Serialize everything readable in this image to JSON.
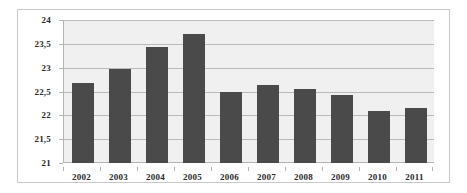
{
  "chart_data": {
    "type": "bar",
    "title": "",
    "subtitle": "",
    "xlabel": "",
    "ylabel": "",
    "categories": [
      "2002",
      "2003",
      "2004",
      "2005",
      "2006",
      "2007",
      "2008",
      "2009",
      "2010",
      "2011"
    ],
    "values": [
      22.68,
      22.98,
      23.44,
      23.7,
      22.5,
      22.64,
      22.55,
      22.42,
      22.1,
      22.16
    ],
    "series": [
      {
        "name": "",
        "values": [
          22.68,
          22.98,
          23.44,
          23.7,
          22.5,
          22.64,
          22.55,
          22.42,
          22.1,
          22.16
        ]
      }
    ],
    "ylim": [
      21,
      24
    ],
    "ytick_values": [
      21,
      21.5,
      22,
      22.5,
      23,
      23.5,
      24
    ],
    "ytick_labels": [
      "21",
      "21,5",
      "22",
      "22,5",
      "23",
      "23,5",
      "24"
    ],
    "xtick_labels": [
      "2002",
      "2003",
      "2004",
      "2005",
      "2006",
      "2007",
      "2008",
      "2009",
      "2010",
      "2011"
    ],
    "grid": true,
    "grid_axis": "y",
    "legend": false,
    "legend_position": "none",
    "decimal_separator": ",",
    "annotations": []
  },
  "style": {
    "bar_color": "#4a4a4a",
    "plot_background": "#f0f0f0",
    "gridline_color": "#b9b9b9",
    "axis_color": "#b4b4b4",
    "frame_border_color": "#c8c8c8",
    "page_background": "#ffffff",
    "tick_label_color": "#2a2a2a"
  }
}
